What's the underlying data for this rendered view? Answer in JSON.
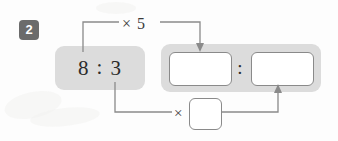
{
  "problem": {
    "number": "2",
    "type": "equivalent-ratio-fill-in"
  },
  "given_ratio": {
    "antecedent": "8",
    "separator": ":",
    "consequent": "3"
  },
  "result_ratio": {
    "antecedent_value": "",
    "separator": ":",
    "consequent_value": "",
    "antecedent_placeholder": "",
    "consequent_placeholder": ""
  },
  "operations": {
    "top": {
      "symbol": "×",
      "label": "× 5",
      "factor": "5",
      "source": "antecedent",
      "target": "result-antecedent"
    },
    "bottom": {
      "symbol": "×",
      "label": "×",
      "factor": "",
      "factor_placeholder": "",
      "source": "consequent",
      "target": "result-consequent"
    }
  },
  "colors": {
    "panel": "#dcdcdc",
    "badge": "#6b6b6b",
    "badge_text": "#ffffff",
    "stroke": "#8a8a8a",
    "text": "#2b2b2b",
    "page": "#fdfdfd"
  },
  "icons": {
    "arrow_down": "arrow-down-icon",
    "arrow_up": "arrow-up-icon"
  }
}
